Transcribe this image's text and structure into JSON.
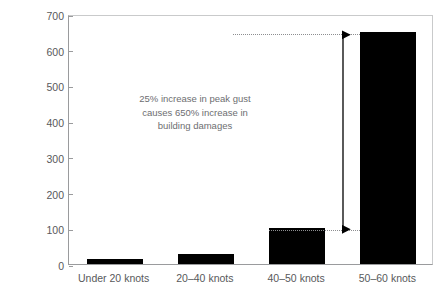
{
  "chart_data": {
    "type": "bar",
    "title": "",
    "subtitle": "",
    "xlabel": "",
    "ylabel": "% Increase in damages",
    "categories": [
      "Under 20 knots",
      "20–40 knots",
      "40–50 knots",
      "50–60 knots"
    ],
    "values": [
      15,
      28,
      100,
      650
    ],
    "ylim": [
      0,
      700
    ],
    "yticks": [
      0,
      100,
      200,
      300,
      400,
      500,
      600,
      700
    ],
    "ytick_labels": [
      "0",
      "100",
      "200",
      "300",
      "400",
      "500",
      "600",
      "700"
    ],
    "grid": false,
    "legend": null,
    "bar_color": "#000000",
    "annotations": [
      {
        "name": "callout-text",
        "lines": [
          "25% increase in peak gust",
          "causes 650% increase in",
          "building damages"
        ]
      },
      {
        "name": "range-arrow",
        "from_value": 100,
        "to_value": 650,
        "style": "double-headed-arrow-with-dotted-guides"
      }
    ]
  },
  "colors": {
    "bar": "#000000",
    "axis": "#9a9b9d",
    "frame": "#c9cacb",
    "text": "#58595b",
    "annotation_text": "#6d6e71",
    "guide": "#8d8e90",
    "background": "#ffffff"
  }
}
